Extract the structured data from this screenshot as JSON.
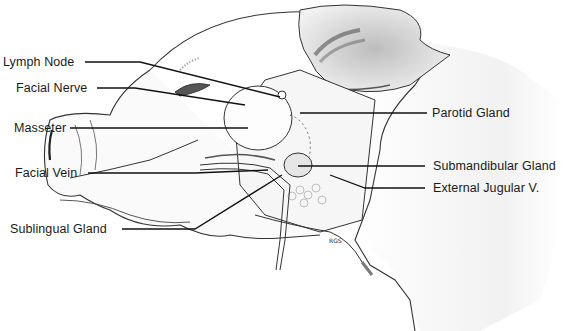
{
  "diagram": {
    "labels_left": [
      {
        "id": "lymph-node",
        "text": "Lymph Node"
      },
      {
        "id": "facial-nerve",
        "text": "Facial Nerve"
      },
      {
        "id": "masseter",
        "text": "Masseter"
      },
      {
        "id": "facial-vein",
        "text": "Facial Vein"
      },
      {
        "id": "sublingual-gland",
        "text": "Sublingual Gland"
      }
    ],
    "labels_right": [
      {
        "id": "parotid-gland",
        "text": "Parotid Gland"
      },
      {
        "id": "submandibular-gland",
        "text": "Submandibular Gland"
      },
      {
        "id": "external-jugular",
        "text": "External Jugular V."
      }
    ],
    "signature": "RGS"
  }
}
